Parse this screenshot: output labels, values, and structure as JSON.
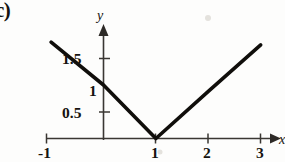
{
  "figure": {
    "part_label": "c)",
    "background_color": "#fdfdfc",
    "ink_color": "#100e0b"
  },
  "axes": {
    "x_axis_name": "x",
    "y_axis_name": "y",
    "x_ticks": [
      {
        "value": -1,
        "label": "-1"
      },
      {
        "value": 1,
        "label": "1"
      },
      {
        "value": 2,
        "label": "2"
      },
      {
        "value": 3,
        "label": "3"
      }
    ],
    "y_ticks": [
      {
        "value": 1.5,
        "label": "1.5"
      },
      {
        "value": 1,
        "label": "1"
      },
      {
        "value": 0.5,
        "label": "0.5"
      }
    ]
  },
  "chart_data": {
    "type": "line",
    "title": "",
    "subtitle": "",
    "xlabel": "x",
    "ylabel": "y",
    "xlim": [
      -1.2,
      3.2
    ],
    "ylim": [
      0,
      1.95
    ],
    "grid": false,
    "legend": "none",
    "annotations": [
      {
        "text": "c)",
        "position": "top-left",
        "role": "part-label"
      }
    ],
    "series": [
      {
        "name": "y = |x - 1|",
        "x": [
          -1,
          1,
          3
        ],
        "values": [
          1.8,
          0,
          1.75
        ],
        "points": [
          {
            "x": -1,
            "y": 1.8
          },
          {
            "x": 0,
            "y": 1.0
          },
          {
            "x": 1,
            "y": 0.0
          },
          {
            "x": 2,
            "y": 0.88
          },
          {
            "x": 3,
            "y": 1.75
          }
        ]
      }
    ],
    "x_tick_values": [
      -1,
      1,
      2,
      3
    ],
    "x_tick_labels": [
      "-1",
      "1",
      "2",
      "3"
    ],
    "y_tick_values": [
      0.5,
      1,
      1.5
    ],
    "y_tick_labels": [
      "0.5",
      "1",
      "1.5"
    ]
  }
}
